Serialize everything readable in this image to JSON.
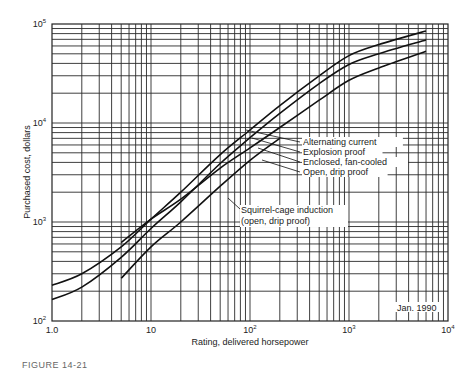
{
  "chart_data": {
    "type": "line",
    "title": "",
    "xlabel": "Rating, delivered horsepower",
    "ylabel": "Purchased cost, dollars",
    "xscale": "log",
    "yscale": "log",
    "xlim": [
      1,
      10000
    ],
    "ylim": [
      100,
      100000
    ],
    "grid": true,
    "x_ticks": [
      "1.0",
      "10",
      "10^2",
      "10^3",
      "10^4"
    ],
    "y_ticks": [
      "10^2",
      "10^3",
      "10^4",
      "10^5"
    ],
    "annotation": "Jan. 1990",
    "series": [
      {
        "name": "Alternating current",
        "x": [
          1,
          2,
          5,
          10,
          20,
          50,
          100,
          200,
          500,
          1000,
          2000,
          6000
        ],
        "y": [
          230,
          300,
          560,
          1070,
          2000,
          4800,
          8500,
          15000,
          30000,
          48000,
          62000,
          85000
        ]
      },
      {
        "name": "Explosion proof",
        "x": [
          1,
          2,
          5,
          10,
          20,
          50,
          100,
          200,
          500,
          1000,
          2000,
          6000
        ],
        "y": [
          165,
          220,
          440,
          860,
          1600,
          3900,
          7100,
          12500,
          25000,
          39000,
          50000,
          69000
        ]
      },
      {
        "name": "Enclosed, fan-cooled",
        "x": [
          5,
          10,
          20,
          50,
          100,
          200,
          500,
          1000,
          2000,
          6000
        ],
        "y": [
          620,
          1070,
          1700,
          3500,
          5600,
          9000,
          17000,
          27000,
          36000,
          53000
        ]
      },
      {
        "name": "Open, drip proof",
        "x": [
          5,
          10,
          20,
          50,
          100,
          200
        ],
        "y": [
          270,
          560,
          1000,
          2300,
          4200,
          7000
        ]
      }
    ],
    "legend_labels": [
      "Alternating current",
      "Explosion proof",
      "Enclosed, fan-cooled",
      "Open, drip proof"
    ],
    "group_label": [
      "Squirrel-cage induction",
      "(open, drip proof)"
    ]
  },
  "labels": {
    "ylabel": "Purchased cost, dollars",
    "xlabel": "Rating, delivered horsepower",
    "date": "Jan. 1990",
    "legend": [
      "Alternating current",
      "Explosion proof",
      "Enclosed, fan-cooled",
      "Open, drip proof"
    ],
    "group1": "Squirrel-cage induction",
    "group2": "(open, drip proof)",
    "caption": "FIGURE 14-21"
  }
}
